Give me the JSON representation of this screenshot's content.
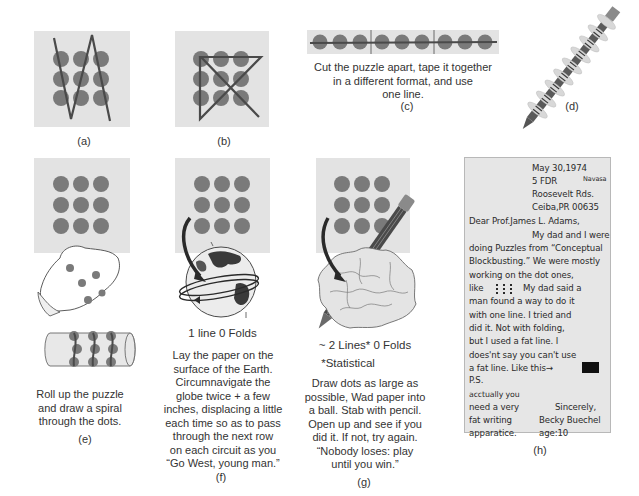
{
  "figure": {
    "panels": [
      {
        "id": "a",
        "label": "(a)",
        "description": []
      },
      {
        "id": "b",
        "label": "(b)",
        "description": []
      },
      {
        "id": "c",
        "label": "(c)",
        "description": [
          "Cut the puzzle apart, tape it together",
          "in a different format, and use",
          "one line."
        ]
      },
      {
        "id": "d",
        "label": "(d)",
        "description": []
      },
      {
        "id": "e",
        "label": "(e)",
        "description": [
          "Roll up the puzzle",
          "and draw a spiral",
          "through the dots."
        ]
      },
      {
        "id": "f",
        "label": "(f)",
        "subtitle": "1 line 0 Folds",
        "description": [
          "Lay the paper on the",
          "surface of the Earth.",
          "Circumnavigate the",
          "globe twice + a few",
          "inches, displacing a little",
          "each time so as to pass",
          "through the next row",
          "on each circuit as you",
          "“Go West, young man.”"
        ]
      },
      {
        "id": "g",
        "label": "(g)",
        "subtitle": "~ 2 Lines* 0 Folds",
        "footnote": "*Statistical",
        "description": [
          "Draw dots as large as",
          "possible, Wad paper into",
          "a ball. Stab with pencil.",
          "Open up and see if you",
          "did it. If not, try again.",
          "“Nobody loses: play",
          "until you win.”"
        ]
      },
      {
        "id": "h",
        "label": "(h)",
        "description": []
      }
    ],
    "letter": {
      "date": "May 30,1974",
      "address": [
        "5 FDR",
        "Roosevelt Rds.",
        "Ceiba,PR 00635"
      ],
      "address_note": "Navasa",
      "salutation": "Dear Prof.James L. Adams,",
      "body": [
        "My dad and I were",
        "doing Puzzles from “Conceptual",
        "Blockbusting.” We were mostly",
        "working on the dot ones,",
        "like",
        "My dad said a",
        "man found a way to do it",
        "with one line.  I tried and",
        "did it. Not with folding,",
        "but I used a fat line. I",
        "does'nt say you can't use",
        "a fat line.  Like this→"
      ],
      "ps_label": "P.S.",
      "ps_text": [
        "acctually you",
        "need a very",
        "fat writing",
        "apparatice."
      ],
      "closing": "Sincerely,",
      "signature": "Becky Buechel",
      "age": "age:10"
    },
    "colors": {
      "panel_bg": "#e3e3e3",
      "dot": "#7a7a7a",
      "line": "#4a4a4a",
      "letter_bg": "#e6e6e6",
      "text": "#333333"
    }
  }
}
